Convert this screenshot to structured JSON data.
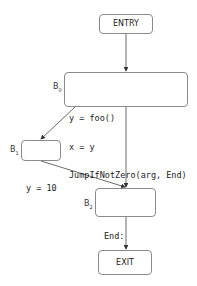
{
  "diagram": {
    "type": "control-flow-graph",
    "nodes": [
      {
        "id": "entry",
        "text": "ENTRY"
      },
      {
        "id": "b0",
        "label": "B",
        "label_sub": "0",
        "lines": [
          "y = foo()",
          "x = y",
          "JumpIfNotZero(arg, End)"
        ]
      },
      {
        "id": "b1",
        "label": "B",
        "label_sub": "1",
        "lines": [
          "y = 10"
        ]
      },
      {
        "id": "b2",
        "label": "B",
        "label_sub": "2",
        "lines": [
          "End:",
          "Return(x)"
        ]
      },
      {
        "id": "exit",
        "text": "EXIT"
      }
    ],
    "edges": [
      {
        "from": "entry",
        "to": "b0"
      },
      {
        "from": "b0",
        "to": "b1"
      },
      {
        "from": "b0",
        "to": "b2"
      },
      {
        "from": "b1",
        "to": "b2"
      },
      {
        "from": "b2",
        "to": "exit"
      }
    ]
  }
}
